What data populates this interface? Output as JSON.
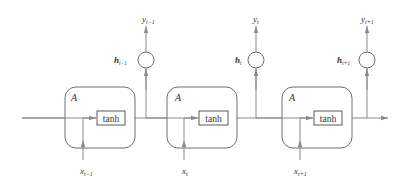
{
  "diagram": {
    "type": "unrolled-rnn",
    "colors": {
      "line": "#8a8a8a",
      "box": "#6e6e6e",
      "text": "#333333"
    },
    "cells": [
      {
        "cell_label": "A",
        "activation": "tanh",
        "input": {
          "base": "x",
          "sub": "t−1"
        },
        "hidden": {
          "base": "h",
          "sub": "t−1"
        },
        "output": {
          "base": "y",
          "sub": "t−1"
        }
      },
      {
        "cell_label": "A",
        "activation": "tanh",
        "input": {
          "base": "x",
          "sub": "t"
        },
        "hidden": {
          "base": "h",
          "sub": "t"
        },
        "output": {
          "base": "y",
          "sub": "t"
        }
      },
      {
        "cell_label": "A",
        "activation": "tanh",
        "input": {
          "base": "x",
          "sub": "t+1"
        },
        "hidden": {
          "base": "h",
          "sub": "t+1"
        },
        "output": {
          "base": "y",
          "sub": "t+1"
        }
      }
    ]
  }
}
